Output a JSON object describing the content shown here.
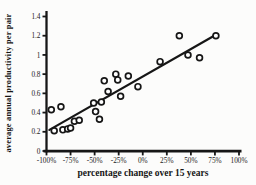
{
  "figure": {
    "background": "#fcfcfb",
    "ink_color": "#161616",
    "marker_fill": "#ffffff"
  },
  "chart_data": {
    "type": "scatter",
    "title": "",
    "xlabel": "percentage change over 15 years",
    "ylabel": "average annual productivity per pair",
    "xlim": [
      -100,
      100
    ],
    "ylim": [
      0,
      1.4
    ],
    "grid": false,
    "legend": "none",
    "x_ticks": [
      {
        "value": -100,
        "label": "-100%"
      },
      {
        "value": -75,
        "label": "-75%"
      },
      {
        "value": -50,
        "label": "-50%"
      },
      {
        "value": -25,
        "label": "-25%"
      },
      {
        "value": 0,
        "label": "0%"
      },
      {
        "value": 25,
        "label": "25%"
      },
      {
        "value": 50,
        "label": "50%"
      },
      {
        "value": 75,
        "label": "75%"
      },
      {
        "value": 100,
        "label": "100%"
      }
    ],
    "y_ticks": [
      {
        "value": 0,
        "label": "0"
      },
      {
        "value": 0.2,
        "label": "0.2"
      },
      {
        "value": 0.4,
        "label": "0.4"
      },
      {
        "value": 0.6,
        "label": "0.6"
      },
      {
        "value": 0.8,
        "label": "0.8"
      },
      {
        "value": 1,
        "label": "1"
      },
      {
        "value": 1.2,
        "label": "1.2"
      },
      {
        "value": 1.4,
        "label": "1.4"
      }
    ],
    "points": [
      {
        "x": -95,
        "y": 0.43
      },
      {
        "x": -92,
        "y": 0.21
      },
      {
        "x": -85,
        "y": 0.46
      },
      {
        "x": -83,
        "y": 0.22
      },
      {
        "x": -78,
        "y": 0.23
      },
      {
        "x": -75,
        "y": 0.24
      },
      {
        "x": -71,
        "y": 0.31
      },
      {
        "x": -66,
        "y": 0.32
      },
      {
        "x": -51,
        "y": 0.5
      },
      {
        "x": -49,
        "y": 0.41
      },
      {
        "x": -45,
        "y": 0.33
      },
      {
        "x": -43,
        "y": 0.51
      },
      {
        "x": -40,
        "y": 0.73
      },
      {
        "x": -36,
        "y": 0.62
      },
      {
        "x": -28,
        "y": 0.8
      },
      {
        "x": -26,
        "y": 0.74
      },
      {
        "x": -23,
        "y": 0.57
      },
      {
        "x": -15,
        "y": 0.78
      },
      {
        "x": -5,
        "y": 0.67
      },
      {
        "x": 18,
        "y": 0.93
      },
      {
        "x": 38,
        "y": 1.2
      },
      {
        "x": 47,
        "y": 1.0
      },
      {
        "x": 59,
        "y": 0.97
      },
      {
        "x": 76,
        "y": 1.2
      }
    ],
    "trendline": {
      "x1": -97,
      "y1": 0.22,
      "x2": 76,
      "y2": 1.21
    }
  }
}
